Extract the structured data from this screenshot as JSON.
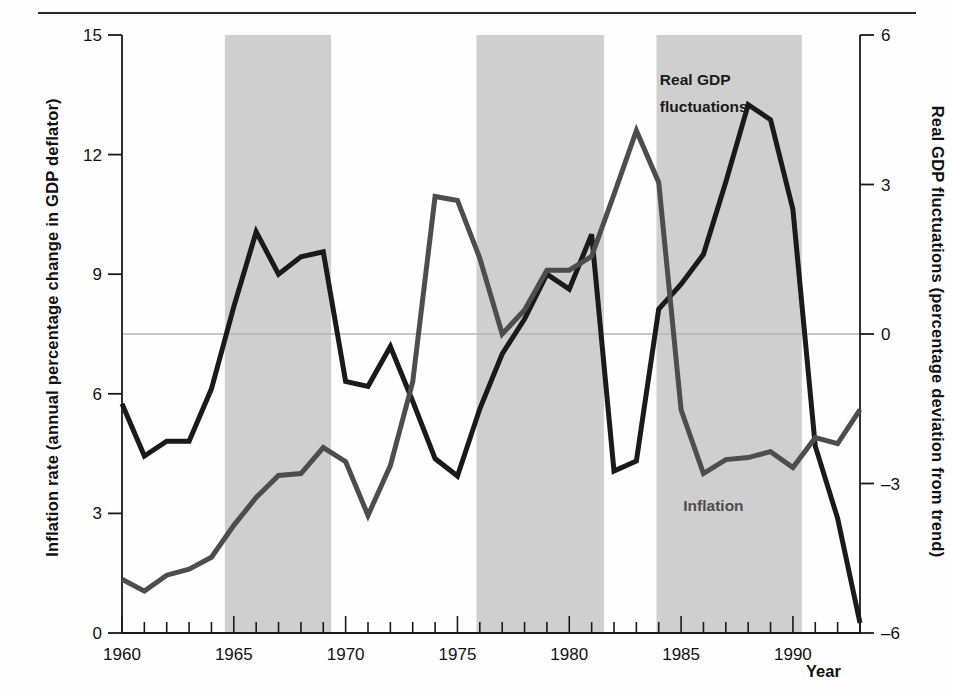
{
  "figure": {
    "background": "#ffffff",
    "axis_color": "#1a1a1a",
    "shade_color": "#cfcfcf",
    "zero_line_color": "#b5b5b5"
  },
  "axes": {
    "x": {
      "label": "Year",
      "min": 1960,
      "max": 1993,
      "tick_labels": [
        "1960",
        "1965",
        "1970",
        "1975",
        "1980",
        "1985",
        "1990"
      ],
      "tick_values": [
        1960,
        1965,
        1970,
        1975,
        1980,
        1985,
        1990
      ],
      "minor_ticks_every": 1
    },
    "y_left": {
      "label": "Inflation rate (annual percentage change in GDP deflator)",
      "min": 0,
      "max": 15,
      "tick_labels": [
        "0",
        "3",
        "6",
        "9",
        "12",
        "15"
      ],
      "tick_values": [
        0,
        3,
        6,
        9,
        12,
        15
      ]
    },
    "y_right": {
      "label": "Real GDP fluctuations (percentage deviation from trend)",
      "min": -6,
      "max": 6,
      "tick_labels": [
        "–6",
        "–3",
        "0",
        "3",
        "6"
      ],
      "tick_values": [
        -6,
        -3,
        0,
        3,
        6
      ]
    }
  },
  "annotations": [
    {
      "name": "real-gdp-label",
      "text": "Real GDP",
      "x": 1984.05,
      "y_axis": "right",
      "y": 5.0,
      "color": "#1a1a1a"
    },
    {
      "name": "real-gdp-label-2",
      "text": "fluctuations",
      "x": 1984.05,
      "y_axis": "right",
      "y": 4.45,
      "color": "#1a1a1a"
    },
    {
      "name": "inflation-label",
      "text": "Inflation",
      "x": 1985.1,
      "y_axis": "left",
      "y": 3.05,
      "color": "#4d4d4d"
    }
  ],
  "recession_bands": [
    {
      "start": 1964.6,
      "end": 1969.35
    },
    {
      "start": 1975.85,
      "end": 1981.55
    },
    {
      "start": 1983.9,
      "end": 1990.4
    }
  ],
  "chart_data": {
    "type": "line",
    "title": "",
    "xlabel": "Year",
    "ylabel": "Inflation rate (annual percentage change in GDP deflator)",
    "ylabel_right": "Real GDP fluctuations (percentage deviation from trend)",
    "xlim": [
      1960,
      1993
    ],
    "ylim": [
      0,
      15
    ],
    "ylim_right": [
      -6,
      6
    ],
    "grid": false,
    "legend": "inline-annotations",
    "zero_reference_line": {
      "axis": "right",
      "value": 0,
      "left_equivalent": 7.5
    },
    "x": [
      1960,
      1961,
      1962,
      1963,
      1964,
      1965,
      1966,
      1967,
      1968,
      1969,
      1970,
      1971,
      1972,
      1973,
      1974,
      1975,
      1976,
      1977,
      1978,
      1979,
      1980,
      1981,
      1982,
      1983,
      1984,
      1985,
      1986,
      1987,
      1988,
      1989,
      1990,
      1991,
      1992,
      1993
    ],
    "series": [
      {
        "name": "Real GDP fluctuations",
        "axis": "right",
        "color": "#1a1a1a",
        "width": 5,
        "values": [
          -1.4,
          -2.45,
          -2.15,
          -2.15,
          -1.1,
          0.55,
          2.05,
          1.2,
          1.55,
          1.65,
          -0.95,
          -1.05,
          -0.25,
          -1.35,
          -2.5,
          -2.85,
          -1.5,
          -0.4,
          0.3,
          1.2,
          0.9,
          2.0,
          -2.75,
          -2.55,
          0.5,
          1.0,
          1.6,
          3.05,
          4.6,
          4.3,
          2.5,
          -2.25,
          -3.7,
          -5.8
        ]
      },
      {
        "name": "Inflation",
        "axis": "left",
        "color": "#4d4d4d",
        "width": 5,
        "values": [
          1.35,
          1.05,
          1.45,
          1.6,
          1.9,
          2.7,
          3.4,
          3.95,
          4.0,
          4.65,
          4.3,
          2.95,
          4.2,
          6.3,
          10.95,
          10.85,
          9.4,
          7.5,
          8.1,
          9.1,
          9.1,
          9.45,
          11.0,
          12.6,
          11.3,
          5.6,
          4.0,
          4.35,
          4.4,
          4.55,
          4.15,
          4.9,
          4.75,
          5.6
        ]
      }
    ]
  }
}
